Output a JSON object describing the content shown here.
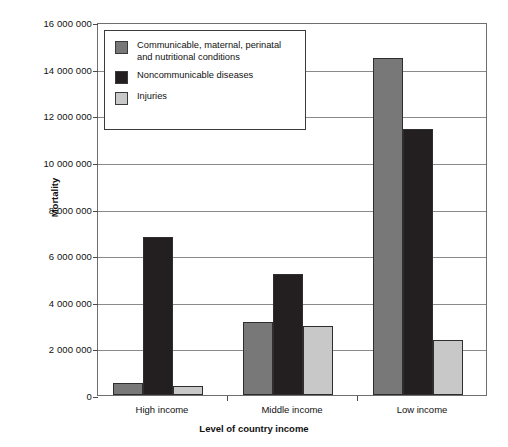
{
  "chart_data": {
    "type": "bar",
    "title": "",
    "xlabel": "Level of country income",
    "ylabel": "Mortality",
    "categories": [
      "High income",
      "Middle income",
      "Low income"
    ],
    "series": [
      {
        "name": "Communicable, maternal, perinatal and nutritional conditions",
        "color": "#787878",
        "values": [
          500000,
          3130000,
          14450000
        ]
      },
      {
        "name": "Noncommunicable diseases",
        "color": "#231f20",
        "values": [
          6780000,
          5200000,
          11400000
        ]
      },
      {
        "name": "Injuries",
        "color": "#c8c8c8",
        "values": [
          380000,
          2960000,
          2350000
        ]
      }
    ],
    "ylim": [
      0,
      16000000
    ],
    "ytick_values": [
      0,
      2000000,
      4000000,
      6000000,
      8000000,
      10000000,
      12000000,
      14000000,
      16000000
    ],
    "ytick_labels": [
      "0",
      "2 000 000",
      "4 000 000",
      "6 000 000",
      "8 000 000",
      "10 000 000",
      "12 000 000",
      "14 000 000",
      "16 000 000"
    ],
    "grid": true,
    "legend_position": "upper-left-inside"
  },
  "legend": {
    "items": [
      {
        "label": "Communicable, maternal, perinatal\nand nutritional conditions",
        "color": "#787878"
      },
      {
        "label": "Noncommunicable diseases",
        "color": "#231f20"
      },
      {
        "label": "Injuries",
        "color": "#c8c8c8"
      }
    ]
  }
}
